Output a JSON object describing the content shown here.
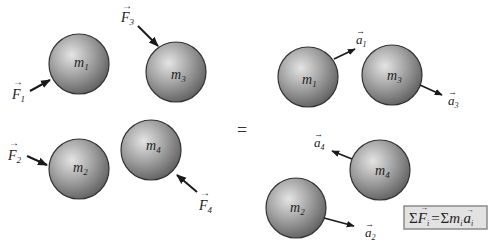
{
  "diagram": {
    "type": "newton-second-law-system-of-particles",
    "colors": {
      "sphere_light": "#d8d8d8",
      "sphere_dark": "#6e6e6e",
      "outline": "#333333",
      "arrow": "#1a1a1a",
      "box_fill": "#e2e2e2",
      "box_border": "#8a8a8a"
    },
    "left_panel": {
      "masses": [
        {
          "label": "m",
          "sub": "1"
        },
        {
          "label": "m",
          "sub": "3"
        },
        {
          "label": "m",
          "sub": "2"
        },
        {
          "label": "m",
          "sub": "4"
        }
      ],
      "forces": [
        {
          "label": "F",
          "sub": "1"
        },
        {
          "label": "F",
          "sub": "3"
        },
        {
          "label": "F",
          "sub": "2"
        },
        {
          "label": "F",
          "sub": "4"
        }
      ]
    },
    "equals_sign": "=",
    "right_panel": {
      "masses": [
        {
          "label": "m",
          "sub": "1"
        },
        {
          "label": "m",
          "sub": "3"
        },
        {
          "label": "m",
          "sub": "4"
        },
        {
          "label": "m",
          "sub": "2"
        }
      ],
      "accelerations": [
        {
          "label": "a",
          "sub": "1"
        },
        {
          "label": "a",
          "sub": "3"
        },
        {
          "label": "a",
          "sub": "4"
        },
        {
          "label": "a",
          "sub": "2"
        }
      ]
    },
    "equation": {
      "lhs_sigma": "Σ",
      "lhs_var": "F",
      "lhs_sub": "i",
      "equals": "=",
      "rhs_sigma": "Σ",
      "rhs_m": "m",
      "rhs_m_sub": "i",
      "rhs_a": "a",
      "rhs_a_sub": "i"
    }
  }
}
